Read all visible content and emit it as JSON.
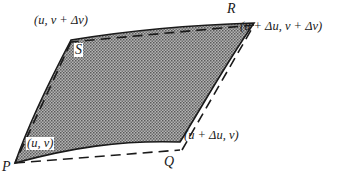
{
  "diagram": {
    "fill_pattern": "stippled gray",
    "colors": {
      "stroke": "#1a1a1a",
      "fill": "#8c8c8c",
      "background": "#ffffff"
    },
    "vertices": {
      "P": {
        "label": "P",
        "coord_label": "(u, v)"
      },
      "Q": {
        "label": "Q",
        "coord_label": "(u + Δu, v)"
      },
      "R": {
        "label": "R",
        "coord_label": "(u + Δu, v + Δv)"
      },
      "S": {
        "label": "S",
        "coord_label": "(u, v + Δv)"
      }
    },
    "edges": [
      {
        "from": "P",
        "to": "Q",
        "curved": "solid",
        "chord": "dashed"
      },
      {
        "from": "Q",
        "to": "R",
        "curved": "solid",
        "chord": "dashed"
      },
      {
        "from": "R",
        "to": "S",
        "curved": "solid",
        "chord": "dashed"
      },
      {
        "from": "S",
        "to": "P",
        "curved": "solid",
        "chord": "dashed"
      }
    ]
  }
}
